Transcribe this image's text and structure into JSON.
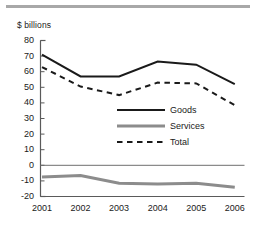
{
  "figure": {
    "unit_label": "$ billions",
    "top_rule": "horizontal-rule"
  },
  "chart_data": {
    "type": "line",
    "title": "",
    "subtitle": "",
    "xlabel": "",
    "ylabel": "$ billions",
    "categories": [
      "2001",
      "2002",
      "2003",
      "2004",
      "2005",
      "2006"
    ],
    "x": [
      2001,
      2002,
      2003,
      2004,
      2005,
      2006
    ],
    "series": [
      {
        "name": "Goods",
        "style": "solid",
        "color": "#1a1a1a",
        "width": 2,
        "values": [
          71,
          57,
          57,
          66.5,
          64.5,
          52
        ]
      },
      {
        "name": "Services",
        "style": "solid",
        "color": "#8c8c8c",
        "width": 3,
        "values": [
          -7.5,
          -6.5,
          -11.5,
          -12,
          -11.5,
          -14
        ]
      },
      {
        "name": "Total",
        "style": "dashed",
        "color": "#1a1a1a",
        "width": 2,
        "values": [
          63,
          50.5,
          45,
          53,
          52.5,
          38.5
        ]
      }
    ],
    "ylim": [
      -20,
      80
    ],
    "yticks": [
      80,
      70,
      60,
      50,
      40,
      30,
      20,
      10,
      0,
      -10,
      -20
    ],
    "ytick_labels": [
      "80",
      "70",
      "60",
      "50",
      "40",
      "30",
      "20",
      "10",
      "0",
      "-10",
      "-20"
    ],
    "xtick_labels": [
      "2001",
      "2002",
      "2003",
      "2004",
      "2005",
      "2006"
    ],
    "grid": false,
    "zero_line": true,
    "legend_position": "center-right-inside",
    "legend": [
      {
        "label": "Goods",
        "style": "solid",
        "color": "#1a1a1a"
      },
      {
        "label": "Services",
        "style": "solid",
        "color": "#8c8c8c"
      },
      {
        "label": "Total",
        "style": "dashed",
        "color": "#1a1a1a"
      }
    ]
  }
}
